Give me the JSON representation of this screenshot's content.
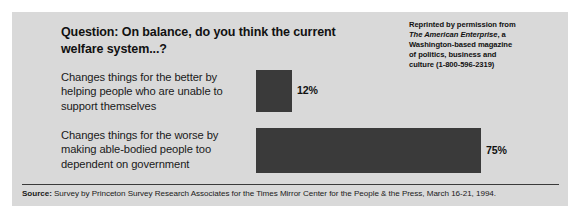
{
  "chart_data": {
    "type": "bar",
    "orientation": "horizontal",
    "title": "Question: On balance, do you think the current welfare system...?",
    "categories": [
      "Changes things for the better by helping people who are unable to support themselves",
      "Changes things for the worse by making able-bodied people too dependent on government"
    ],
    "values": [
      12,
      75
    ],
    "value_labels": [
      "12%",
      "75%"
    ],
    "xlabel": "",
    "ylabel": "",
    "xlim": [
      0,
      100
    ],
    "grid": false,
    "legend": false,
    "bar_color": "#3a3a3a",
    "background_color": "#d9d9d9"
  },
  "header": {
    "question_line1": "Question: On balance, do you think the current",
    "question_line2": "welfare system...?",
    "reprint_line1": "Reprinted by permission from",
    "reprint_italic": "The American Enterprise",
    "reprint_line2_tail": ", a",
    "reprint_line3": "Washington-based magazine",
    "reprint_line4": "of politics, business and",
    "reprint_line5": "culture (1-800-596-2319)"
  },
  "bars": [
    {
      "label_line1": "Changes things for the better by",
      "label_line2": "helping people who are unable to",
      "label_line3": "support themselves",
      "value_label": "12%"
    },
    {
      "label_line1": "Changes things for the worse by",
      "label_line2": "making able-bodied people too",
      "label_line3": "dependent on government",
      "value_label": "75%"
    }
  ],
  "footer": {
    "source_label": "Source:",
    "source_text": " Survey by Princeton Survey Research Associates for the Times Mirror Center for the People & the Press, March 16-21, 1994."
  }
}
